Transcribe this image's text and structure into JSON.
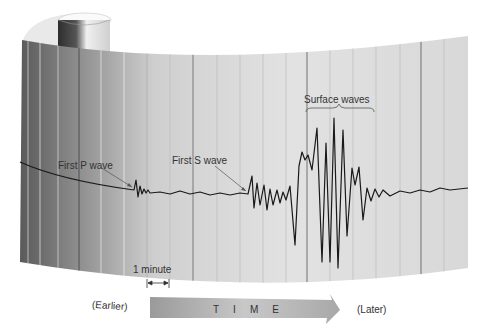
{
  "labels": {
    "first_p_wave": "First P wave",
    "first_s_wave": "First S wave",
    "surface_waves": "Surface waves",
    "one_minute": "1 minute",
    "earlier": "(Earlier)",
    "later": "(Later)",
    "time": "TIME"
  },
  "colors": {
    "trace": "#1a1a1a",
    "paper_light": "#e4e4e4",
    "paper_dark": "#5e5e5e",
    "arrow_fill": "#b5b5b5",
    "text": "#333333"
  }
}
